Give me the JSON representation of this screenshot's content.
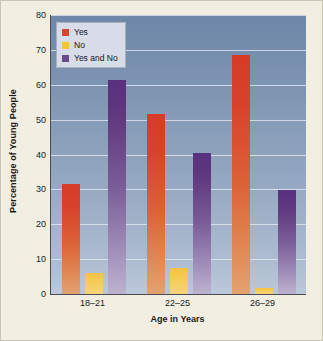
{
  "chart_data": {
    "type": "bar",
    "title": "",
    "xlabel": "Age in Years",
    "ylabel": "Percentage of Young People",
    "categories": [
      "18–21",
      "22–25",
      "26–29"
    ],
    "series": [
      {
        "name": "Yes",
        "color": "#d9452e",
        "values": [
          31.5,
          51.5,
          68.5
        ]
      },
      {
        "name": "No",
        "color": "#f3c43f",
        "values": [
          6.0,
          7.5,
          1.7
        ]
      },
      {
        "name": "Yes and No",
        "color": "#6b4a8c",
        "values": [
          61.5,
          40.5,
          29.8
        ]
      }
    ],
    "ylim": [
      0,
      80
    ],
    "yticks": [
      0,
      10,
      20,
      30,
      40,
      50,
      60,
      70,
      80
    ],
    "grid": true,
    "legend_position": "top-left",
    "plot_background": "#8097b4",
    "figure_background": "#f2efe2"
  }
}
